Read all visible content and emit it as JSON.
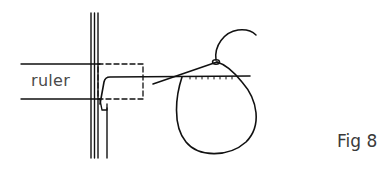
{
  "diagram": {
    "labels": {
      "ruler": "ruler",
      "figure": "Fig 8"
    },
    "elements": [
      "ruler-edge-lines",
      "wall-triple-lines",
      "dashed-ruler-box",
      "hook-needle",
      "yarn-loop",
      "yarn-tail",
      "horizontal-stitch-line"
    ],
    "colors": {
      "ink": "#111111",
      "text": "#4a4a4a",
      "background": "#ffffff"
    }
  }
}
